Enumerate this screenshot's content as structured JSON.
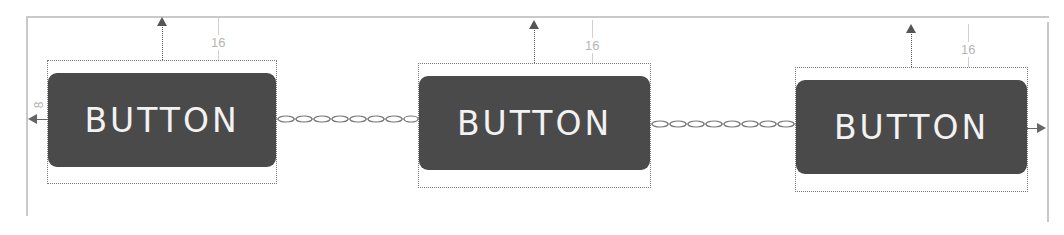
{
  "diagram": {
    "type": "constraint-layout-chain",
    "colors": {
      "button_fill": "#4a4a4a",
      "button_text": "#f2f2f2",
      "frame": "#c9c9c9",
      "dimension_text": "#b5b5b5"
    },
    "buttons": [
      {
        "label": "BUTTON",
        "top_margin": "16"
      },
      {
        "label": "BUTTON",
        "top_margin": "16"
      },
      {
        "label": "BUTTON",
        "top_margin": "16"
      }
    ],
    "left_margin": "8",
    "chain_links": [
      "button1-button2",
      "button2-button3"
    ]
  }
}
